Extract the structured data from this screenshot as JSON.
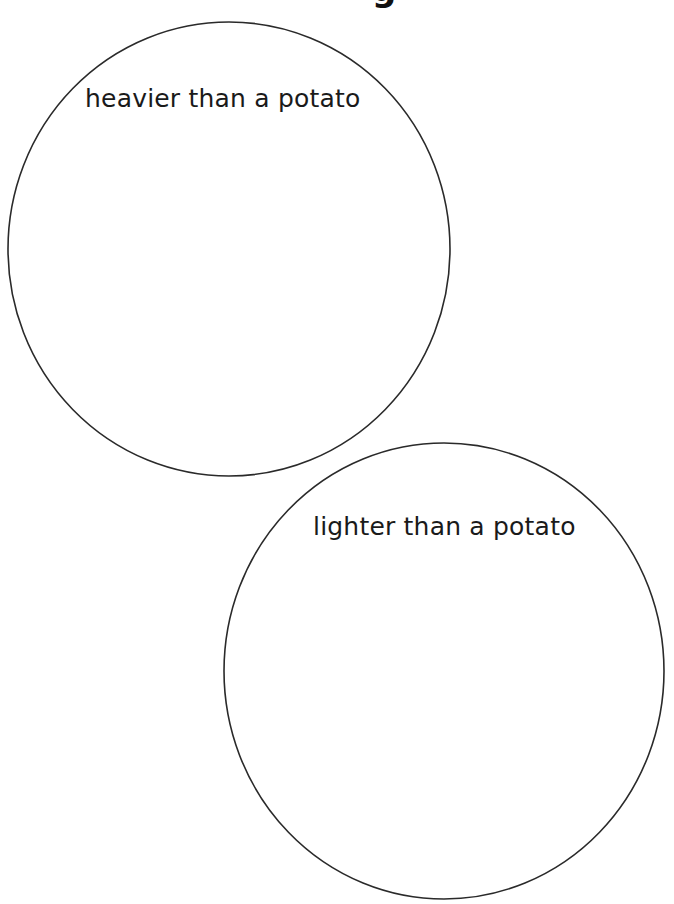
{
  "page": {
    "title_fragment": "g"
  },
  "sorting_circles": [
    {
      "label": "heavier than a potato",
      "cx": 229,
      "cy": 249,
      "rx": 221,
      "ry": 227
    },
    {
      "label": "lighter than a potato",
      "cx": 444,
      "cy": 671,
      "rx": 220,
      "ry": 228
    }
  ],
  "colors": {
    "stroke": "#2a2a2a",
    "text": "#1a1a1a",
    "background": "#ffffff"
  }
}
